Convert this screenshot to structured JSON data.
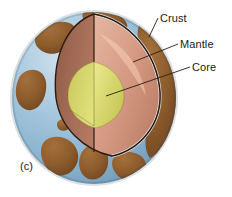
{
  "figure": {
    "caption": "(c)",
    "labels": {
      "crust": "Crust",
      "mantle": "Mantle",
      "core": "Core"
    },
    "layers": [
      {
        "name": "crust",
        "label": "Crust",
        "ocean_color": "#8fb8d4",
        "land_color": "#8a5a2b",
        "edge_color": "#e8eef2"
      },
      {
        "name": "mantle",
        "label": "Mantle",
        "color": "#d79a86",
        "shade_color": "#a5694f",
        "highlight_color": "#e8b9a4"
      },
      {
        "name": "core",
        "label": "Core",
        "color": "#dede6e",
        "shade_color": "#b8b84a",
        "highlight_color": "#ecec92"
      }
    ],
    "geometry": {
      "sphere_center_x": 94,
      "sphere_center_y": 98,
      "sphere_radius_x": 82,
      "sphere_radius_y": 86
    },
    "leaders": [
      {
        "name": "crust-leader",
        "x1": 158,
        "y1": 18,
        "x2": 150,
        "y2": 36
      },
      {
        "name": "mantle-leader",
        "x1": 178,
        "y1": 44,
        "x2": 134,
        "y2": 62
      },
      {
        "name": "core-leader",
        "x1": 190,
        "y1": 67,
        "x2": 107,
        "y2": 96
      }
    ],
    "background_color": "#ffffff",
    "line_color": "#2b1a12"
  }
}
